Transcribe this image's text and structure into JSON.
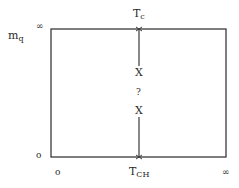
{
  "diagram": {
    "y_axis": {
      "label_main": "m",
      "label_sub": "q",
      "top_value": "∞",
      "bottom_value": "o"
    },
    "x_axis": {
      "left_value": "o",
      "right_value": "∞"
    },
    "top_label": {
      "main": "T",
      "sub": "c"
    },
    "bottom_label": {
      "main": "T",
      "sub": "CH"
    },
    "markers": {
      "upper": "X",
      "middle": "?",
      "lower": "X"
    },
    "line_color": "#3a3a3a"
  }
}
